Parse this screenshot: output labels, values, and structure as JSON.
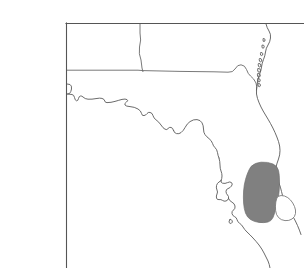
{
  "figure": {
    "width": 304,
    "height": 268,
    "background_color": "#ffffff",
    "title": "",
    "caption": ""
  },
  "frame": {
    "name": "plot-frame",
    "stroke_color": "#555555",
    "stroke_width": 1.1,
    "left_x": 66,
    "top_y": 23,
    "right_x": 304,
    "bottom_y": 268,
    "edges_drawn": [
      "left",
      "top"
    ]
  },
  "map": {
    "region_label": "Florida and adjacent Gulf states",
    "coastline": {
      "name": "coastline",
      "stroke_color": "#5a5a5a",
      "stroke_width": 0.9,
      "fill": "none"
    },
    "state_borders": {
      "name": "state-borders",
      "stroke_color": "#6a6a6a",
      "stroke_width": 0.9,
      "lines": [
        {
          "label": "alabama-georgia-vertical",
          "x1": 140,
          "y1": 23,
          "x2": 140,
          "y2": 70
        },
        {
          "label": "alabama-florida-horizontal",
          "x1": 66,
          "y1": 70,
          "x2": 232,
          "y2": 72
        }
      ]
    },
    "barrier_islands": {
      "name": "barrier-islands",
      "stroke_color": "#5a5a5a",
      "count": 9
    },
    "highlight_regions": [
      {
        "name": "shaded-region-primary",
        "label": "",
        "fill_color": "#808080",
        "stroke_color": "#6e6e6e",
        "bbox": [
          240,
          162,
          281,
          223
        ]
      },
      {
        "name": "shaded-region-secondary",
        "label": "",
        "fill_color": "#ffffff",
        "stroke_color": "#7a7a7a",
        "bbox": [
          277,
          194,
          296,
          221
        ]
      }
    ]
  },
  "annotations": {
    "axis_labels": [],
    "tick_labels": [],
    "legend_entries": [],
    "text_items": []
  }
}
